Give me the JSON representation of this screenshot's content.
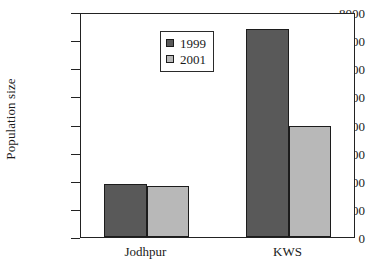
{
  "chart_data": {
    "type": "bar",
    "title": "",
    "xlabel": "",
    "ylabel": "Population size",
    "categories": [
      "Jodhpur",
      "KWS"
    ],
    "series": [
      {
        "name": "1999",
        "values": [
          1900,
          7400
        ],
        "color": "#595959"
      },
      {
        "name": "2001",
        "values": [
          1800,
          3950
        ],
        "color": "#b8b8b8"
      }
    ],
    "ylim": [
      0,
      8000
    ],
    "yticks": [
      0,
      1000,
      2000,
      3000,
      4000,
      5000,
      6000,
      7000,
      8000
    ],
    "ytick_labels": [
      "0",
      "1000",
      "2000",
      "3000",
      "4000",
      "5000",
      "6000",
      "7000",
      "8000"
    ],
    "grid": false,
    "legend_position": "upper left",
    "legend_entries": [
      "1999",
      "2001"
    ],
    "axis_color": "#222222",
    "bar_edge_color": "#1c1c1c"
  }
}
